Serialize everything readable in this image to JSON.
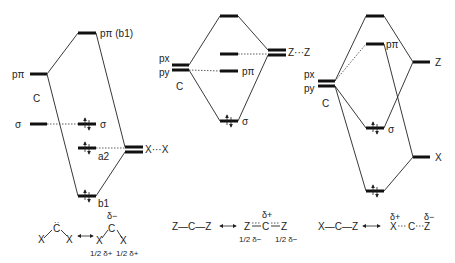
{
  "diagram1": {
    "carbon_label": "C",
    "levels": {
      "p_pi_c": "pπ",
      "sigma_c": "σ",
      "top": "pπ (b1)",
      "sigma_mid": "σ",
      "a2": "a2",
      "b1": "b1",
      "ligand": "X···X"
    },
    "resonance": {
      "left": "X  C  X",
      "right_charge_top": "δ−",
      "right_charge_left": "1/2 δ+",
      "right_charge_right": "1/2 δ+"
    }
  },
  "diagram2": {
    "carbon_label": "C",
    "levels": {
      "px": "px",
      "py": "py",
      "p_pi": "pπ",
      "sigma": "σ",
      "ligand": "Z···Z"
    },
    "resonance": {
      "left": "Z—C—Z",
      "right_charge_top": "δ+",
      "right_charge_left": "1/2 δ−",
      "right_charge_right": "1/2 δ−"
    }
  },
  "diagram3": {
    "carbon_label": "C",
    "levels": {
      "px": "px",
      "py": "py",
      "p_pi": "pπ",
      "sigma": "σ",
      "z": "Z",
      "x": "X"
    },
    "resonance": {
      "left": "X—C—Z",
      "right_charge_x": "δ+",
      "right_charge_z": "δ−"
    }
  }
}
